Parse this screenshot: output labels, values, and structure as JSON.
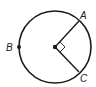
{
  "diagram": {
    "type": "circle-geometry",
    "circle": {
      "cx": 55,
      "cy": 47,
      "r": 36
    },
    "center": {
      "x": 55,
      "y": 47
    },
    "points": [
      {
        "id": "A",
        "label": "A",
        "x": 79,
        "y": 21,
        "label_x": 80,
        "label_y": 19
      },
      {
        "id": "B",
        "label": "B",
        "x": 19,
        "y": 47,
        "label_x": 6,
        "label_y": 51
      },
      {
        "id": "C",
        "label": "C",
        "x": 79,
        "y": 72,
        "label_x": 80,
        "label_y": 82
      }
    ],
    "radii": [
      "A",
      "C"
    ],
    "right_angle_at": "center",
    "stroke_color": "#1a1a1a"
  }
}
